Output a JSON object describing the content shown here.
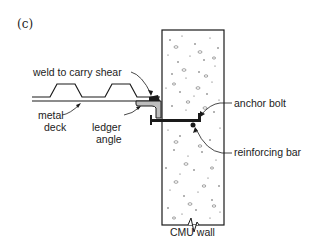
{
  "figure": {
    "label": "(c)",
    "annotations": {
      "weld": "weld to carry shear",
      "metal_deck_line1": "metal",
      "metal_deck_line2": "deck",
      "ledger_line1": "ledger",
      "ledger_line2": "angle",
      "anchor_bolt": "anchor bolt",
      "reinforcing_bar": "reinforcing bar",
      "wall": "CMU wall"
    },
    "colors": {
      "line": "#1a1a1a",
      "ledger_fill": "#bdbdbd",
      "wall_fill": "#ffffff",
      "background": "#ffffff"
    }
  }
}
